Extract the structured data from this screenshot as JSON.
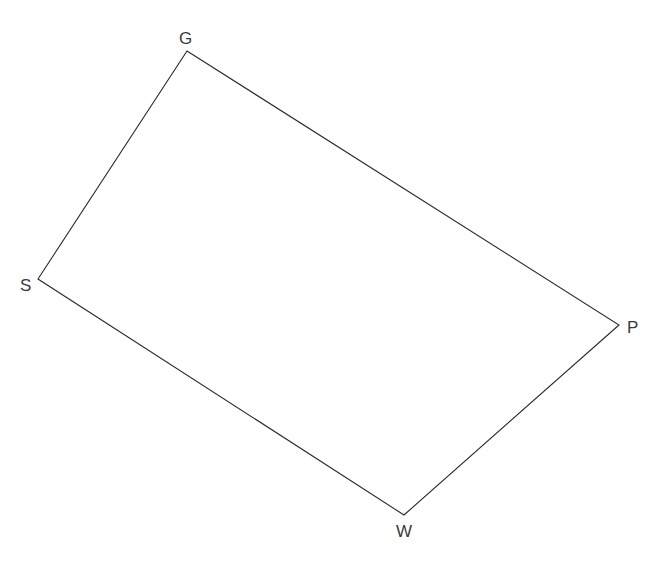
{
  "diagram": {
    "type": "quadrilateral",
    "stroke_color": "#2a2a2a",
    "label_color": "#3a3a3a",
    "vertices": [
      {
        "name": "G",
        "x": 187,
        "y": 51,
        "label_x": 179,
        "label_y": 44
      },
      {
        "name": "P",
        "x": 619,
        "y": 325,
        "label_x": 627,
        "label_y": 333
      },
      {
        "name": "W",
        "x": 404,
        "y": 515,
        "label_x": 396,
        "label_y": 537
      },
      {
        "name": "S",
        "x": 38,
        "y": 279,
        "label_x": 20,
        "label_y": 291
      }
    ],
    "labels": {
      "G": "G",
      "P": "P",
      "W": "W",
      "S": "S"
    }
  }
}
